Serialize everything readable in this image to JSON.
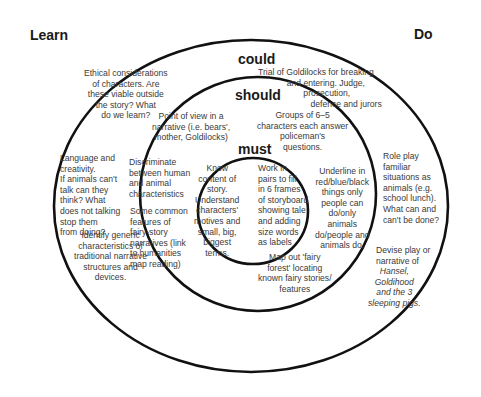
{
  "headings": {
    "learn": "Learn",
    "do": "Do",
    "could": "could",
    "should": "should",
    "must": "must"
  },
  "could": {
    "ethical": "Ethical considerations\nof characters. Are\nthese viable outside\nthe story? What\ndo we learn?",
    "trial": "Trial of Goldilocks for breaking\n            and entering. Judge,\n                   prosecution,\n                      defence and jurors",
    "language": "Language and\ncreativity.\nIf animals can't\ntalk can they\nthink? What\ndoes not talking\nstop them\nfrom doing?",
    "identify": "Identify generic\ncharacteristics of\ntraditional narrative\nstructures and\ndevices.",
    "role_play": "Role play\nfamiliar\nsituations as\nanimals (e.g.\nschool lunch).\nWhat can and\ncan't be done?",
    "devise": "Devise play or\nnarrative of",
    "devise_italic": "Hansel,\nGoldihood\nand the 3\nsleeping pigs."
  },
  "should": {
    "point_of_view": "Point of view in a\nnarrative (i.e. bears',\nmother, Goldilocks)",
    "groups": "Groups of 6–5\ncharacters each answer\npoliceman's\nquestions.",
    "discriminate": "Discriminate\nbetween human\nand animal\ncharacteristics",
    "features": "Some common\nfeatures of\nfairy-story\nnarratives (link\nto humanities\nmap reading)",
    "underline": "Underline in\nred/blue/black\nthings only\npeople can\ndo/only\nanimals\ndo/people and\nanimals do.",
    "map_out": "Map out 'fairy\nforest' locating\nknown fairy stories/\nfeatures"
  },
  "must": {
    "know": "Know\ncontent of\nstory.\nUnderstand\ncharacters'\nmotives and\nsmall, big,\nbiggest\nterms.",
    "work": "Work in\npairs to fill\nin 6 frames\nof storyboard\nshowing tale\nand adding\nsize words\nas labels"
  }
}
